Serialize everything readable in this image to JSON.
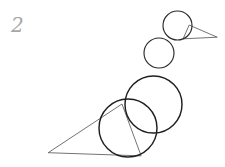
{
  "canvas": {
    "width": 225,
    "height": 167,
    "background_color": "#ffffff",
    "ink_color": "#2b2b2b",
    "light_ink_color": "#5a5a5a",
    "label_color": "#a7a7a7",
    "title": "Sketch 2"
  },
  "label": {
    "text": "2",
    "x": 11,
    "y": 13
  },
  "drawing": {
    "description": "hand-drawn construction sketch of a bird built from overlapping circles and two triangles",
    "shapes": [
      {
        "name": "head-circle",
        "type": "circle",
        "cx": 177.5,
        "cy": 25.5,
        "r": 14.5,
        "stroke": "#2b2b2b"
      },
      {
        "name": "beak-triangle",
        "type": "triangle",
        "points": "189,25 217,37 183,39",
        "stroke": "#5a5a5a"
      },
      {
        "name": "neck-circle",
        "type": "circle",
        "cx": 159,
        "cy": 53,
        "r": 15,
        "stroke": "#2b2b2b"
      },
      {
        "name": "upper-body-circle",
        "type": "circle",
        "cx": 153.5,
        "cy": 104.5,
        "r": 28.5,
        "stroke": "#1f1f1f"
      },
      {
        "name": "lower-body-circle",
        "type": "circle",
        "cx": 128,
        "cy": 128,
        "r": 29,
        "stroke": "#1f1f1f"
      },
      {
        "name": "tail-triangle",
        "type": "triangle",
        "points": "48,152 122,104 140,155",
        "stroke": "#5a5a5a"
      }
    ]
  }
}
